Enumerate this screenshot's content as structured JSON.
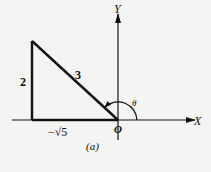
{
  "figure": {
    "caption": "(a)",
    "axes": {
      "x_label": "X",
      "y_label": "Y",
      "origin_label": "O"
    },
    "triangle": {
      "vertical_side_label": "2",
      "hypotenuse_label": "3",
      "horizontal_side_label": "−√5"
    },
    "angle": {
      "label": "θ",
      "description": "angle measured counterclockwise from positive X-axis to hypotenuse"
    },
    "colors": {
      "stroke": "#111111",
      "background": "#f4f4f2"
    }
  }
}
